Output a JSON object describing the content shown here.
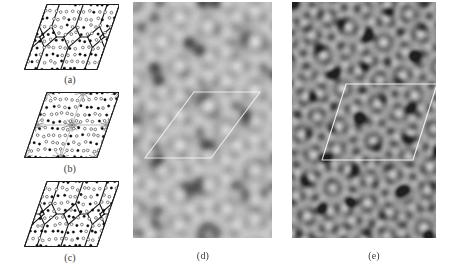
{
  "figure": {
    "background_color": "#ffffff",
    "width": 468,
    "height": 264
  },
  "panels": [
    {
      "id": "a",
      "caption": "(a)",
      "kind": "tiling-diagram",
      "description": "Rhombic unit cell with hexagon-boat-star tiling, filled and open atom circles",
      "caption_x": 70,
      "caption_y": 74,
      "box": {
        "x": 24,
        "y": 4,
        "w": 95,
        "h": 66
      },
      "line_color": "#1a1a1a",
      "fill_color": "#ffffff",
      "atom_open_color": "#ffffff",
      "atom_filled_color": "#111111",
      "shear": 0.34,
      "tile_style": "pentagon-hexagon network",
      "seed": 11
    },
    {
      "id": "b",
      "caption": "(b)",
      "kind": "tiling-diagram",
      "description": "Rhombic unit cell with decagonal cluster nodes and grey connecting network",
      "caption_x": 70,
      "caption_y": 163,
      "box": {
        "x": 24,
        "y": 92,
        "w": 95,
        "h": 66
      },
      "line_color": "#1a1a1a",
      "fill_color": "#ffffff",
      "atom_open_color": "#ffffff",
      "atom_filled_color": "#111111",
      "shear": 0.34,
      "tile_style": "decagonal cluster network",
      "seed": 23
    },
    {
      "id": "c",
      "caption": "(c)",
      "kind": "tiling-diagram",
      "description": "Rhombic unit cell with pentagonal tiling, variant of (a)",
      "caption_x": 70,
      "caption_y": 252,
      "box": {
        "x": 24,
        "y": 181,
        "w": 95,
        "h": 66
      },
      "line_color": "#1a1a1a",
      "fill_color": "#ffffff",
      "atom_open_color": "#ffffff",
      "atom_filled_color": "#111111",
      "shear": 0.34,
      "tile_style": "pentagon-hexagon network",
      "seed": 37
    },
    {
      "id": "d",
      "caption": "(d)",
      "kind": "tem-image",
      "description": "Simulated high-resolution image with large gear-like decagonal rings on light grey background",
      "caption_x": 203,
      "caption_y": 250,
      "box": {
        "x": 133,
        "y": 2,
        "w": 139,
        "h": 236
      },
      "motif": "gear-rings",
      "ring_spacing": 44,
      "ring_radius": 17,
      "teeth": 10,
      "contrast": "light",
      "base_gray": "#a8a8a8",
      "dark_gray": "#3a3a3a",
      "bright_gray": "#f0f0f0",
      "overlay": {
        "shape": "rhombus",
        "color": "#ffffff",
        "opacity": 0.75,
        "points": "12,156 78,156 127,90 61,90"
      },
      "seed": 5
    },
    {
      "id": "e",
      "caption": "(e)",
      "kind": "tem-image",
      "description": "Simulated high-resolution image with fine dark decagonal motifs on grey background, white rhombic unit cell outlined",
      "caption_x": 374,
      "caption_y": 250,
      "box": {
        "x": 292,
        "y": 2,
        "w": 144,
        "h": 236
      },
      "motif": "dark-dots",
      "ring_spacing": 26,
      "ring_radius": 10,
      "teeth": 10,
      "contrast": "dark",
      "base_gray": "#8e8e8e",
      "dark_gray": "#202020",
      "bright_gray": "#e8e8e8",
      "overlay": {
        "shape": "rhombus",
        "color": "#ffffff",
        "opacity": 0.85,
        "points": "30,158 121,158 145,82 54,82"
      },
      "seed": 9
    }
  ],
  "captions": {
    "a": "(a)",
    "b": "(b)",
    "c": "(c)",
    "d": "(d)",
    "e": "(e)"
  }
}
